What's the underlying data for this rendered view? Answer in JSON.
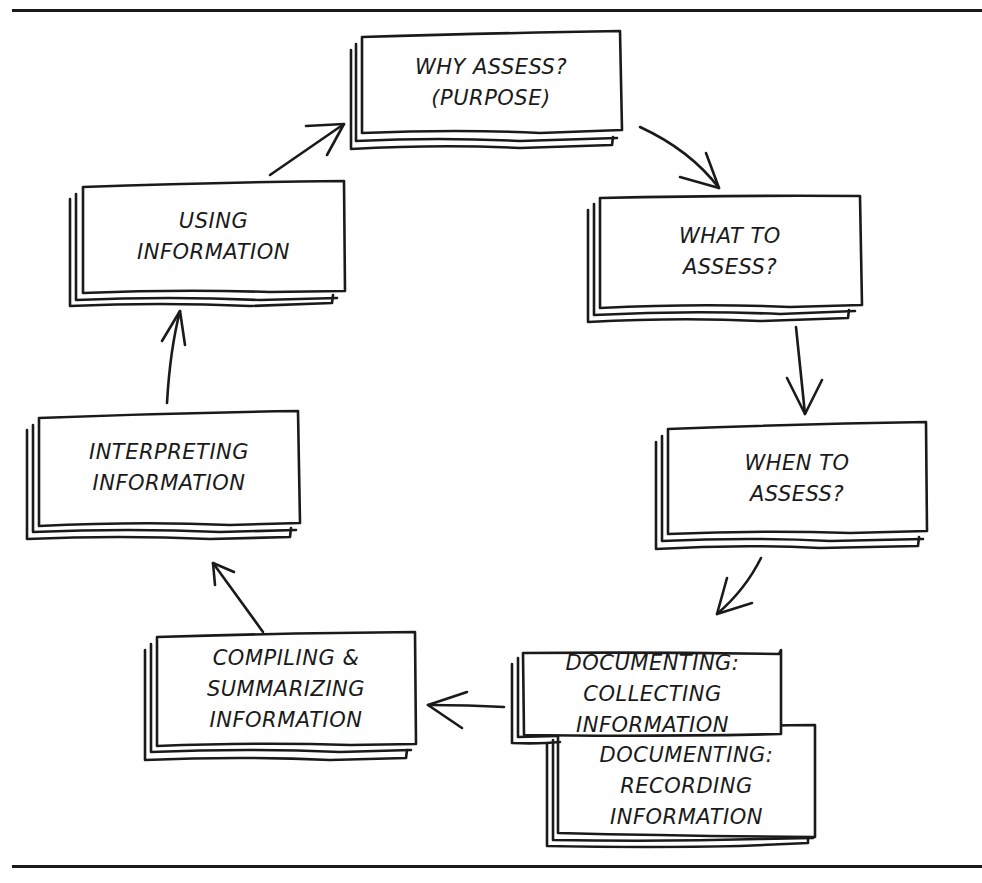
{
  "diagram": {
    "type": "cycle",
    "stroke_color": "#1a1a1a",
    "background": "#ffffff",
    "nodes": [
      {
        "id": "why",
        "lines": [
          "WHY ASSESS?",
          "(PURPOSE)"
        ]
      },
      {
        "id": "what",
        "lines": [
          "WHAT TO",
          "ASSESS?"
        ]
      },
      {
        "id": "when",
        "lines": [
          "WHEN TO",
          "ASSESS?"
        ]
      },
      {
        "id": "collecting",
        "lines": [
          "DOCUMENTING:",
          "COLLECTING",
          "INFORMATION"
        ]
      },
      {
        "id": "recording",
        "lines": [
          "DOCUMENTING:",
          "RECORDING",
          "INFORMATION"
        ]
      },
      {
        "id": "compiling",
        "lines": [
          "COMPILING &",
          "SUMMARIZING",
          "INFORMATION"
        ]
      },
      {
        "id": "interpreting",
        "lines": [
          "INTERPRETING",
          "INFORMATION"
        ]
      },
      {
        "id": "using",
        "lines": [
          "USING",
          "INFORMATION"
        ]
      }
    ],
    "edges": [
      {
        "from": "why",
        "to": "what"
      },
      {
        "from": "what",
        "to": "when"
      },
      {
        "from": "when",
        "to": "collecting"
      },
      {
        "from": "collecting",
        "to": "compiling"
      },
      {
        "from": "compiling",
        "to": "interpreting"
      },
      {
        "from": "interpreting",
        "to": "using"
      },
      {
        "from": "using",
        "to": "why"
      }
    ]
  }
}
